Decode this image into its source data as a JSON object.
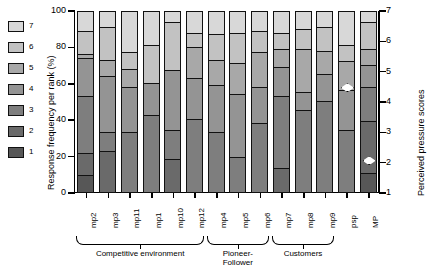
{
  "axes": {
    "ylabel_left": "Response frequency per rank (%)",
    "ylabel_right": "Perceived pressure scores",
    "yticks_left": [
      "0",
      "20",
      "40",
      "60",
      "80",
      "100"
    ],
    "yticks_right": [
      "1",
      "2",
      "3",
      "4",
      "5",
      "6",
      "7"
    ]
  },
  "legend": {
    "title": "",
    "items": [
      {
        "label": "7",
        "color": "#d8d8d8"
      },
      {
        "label": "6",
        "color": "#c2c2c2"
      },
      {
        "label": "5",
        "color": "#a8a8a8"
      },
      {
        "label": "4",
        "color": "#949494"
      },
      {
        "label": "3",
        "color": "#7e7e7e"
      },
      {
        "label": "2",
        "color": "#6a6a6a"
      },
      {
        "label": "1",
        "color": "#575757"
      }
    ]
  },
  "groups": [
    {
      "label": "Competitive environment",
      "start": 0,
      "end": 5
    },
    {
      "label": "Pioneer-\nFollower",
      "label_line1": "Pioneer-",
      "label_line2": "Follower",
      "start": 6,
      "end": 8
    },
    {
      "label": "Customers",
      "start": 9,
      "end": 11
    }
  ],
  "markers": [
    {
      "bar": "psp",
      "value": 4.5,
      "shape": "diamond"
    },
    {
      "bar": "MP",
      "value": 2.1,
      "shape": "diamond"
    }
  ],
  "chart_data": {
    "type": "bar",
    "title": "",
    "xlabel": "",
    "ylabel": "Response frequency per rank (%)",
    "ylabel_secondary": "Perceived pressure scores",
    "ylim": [
      0,
      100
    ],
    "ylim_secondary": [
      1,
      7
    ],
    "stacked": true,
    "normalized_percent": true,
    "grid": false,
    "legend_position": "left-outside",
    "categories": [
      "mp2",
      "mp3",
      "mp11",
      "mp1",
      "mp10",
      "mp12",
      "mp4",
      "mp5",
      "mp6",
      "mp7",
      "mp8",
      "mp9",
      "psp",
      "MP"
    ],
    "series": [
      {
        "name": "1",
        "color": "#575757",
        "values": [
          9,
          0,
          0,
          0,
          0,
          0,
          0,
          0,
          0,
          0,
          0,
          0,
          0,
          10
        ]
      },
      {
        "name": "2",
        "color": "#6a6a6a",
        "values": [
          12,
          22,
          0,
          0,
          18,
          0,
          0,
          0,
          0,
          13,
          0,
          0,
          0,
          29
        ]
      },
      {
        "name": "3",
        "color": "#7e7e7e",
        "values": [
          32,
          11,
          33,
          42,
          16,
          40,
          33,
          19,
          38,
          40,
          45,
          50,
          34,
          19
        ]
      },
      {
        "name": "4",
        "color": "#949494",
        "values": [
          21,
          31,
          25,
          18,
          33,
          23,
          26,
          35,
          20,
          16,
          10,
          15,
          22,
          12
        ]
      },
      {
        "name": "5",
        "color": "#a8a8a8",
        "values": [
          2,
          9,
          10,
          0,
          0,
          17,
          14,
          17,
          19,
          10,
          24,
          13,
          16,
          9
        ]
      },
      {
        "name": "6",
        "color": "#c2c2c2",
        "values": [
          13,
          18,
          9,
          21,
          27,
          8,
          14,
          17,
          12,
          9,
          11,
          13,
          9,
          15
        ]
      },
      {
        "name": "7",
        "color": "#d8d8d8",
        "values": [
          11,
          9,
          23,
          19,
          6,
          12,
          13,
          12,
          11,
          12,
          10,
          9,
          19,
          6
        ]
      }
    ]
  }
}
